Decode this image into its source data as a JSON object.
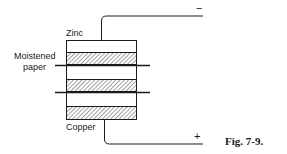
{
  "diagram": {
    "labels": {
      "zinc": "Zinc",
      "moistened_line1": "Moistened",
      "moistened_line2": "paper",
      "copper": "Copper",
      "negative": "−",
      "positive": "+"
    },
    "caption": "Fig. 7-9.",
    "layers": [
      {
        "type": "zinc",
        "hatched": false
      },
      {
        "type": "copper",
        "hatched": true
      },
      {
        "type": "moistened-paper",
        "divider": true
      },
      {
        "type": "zinc",
        "hatched": false
      },
      {
        "type": "copper",
        "hatched": true
      },
      {
        "type": "moistened-paper",
        "divider": true
      },
      {
        "type": "zinc",
        "hatched": false
      },
      {
        "type": "copper",
        "hatched": true
      }
    ],
    "colors": {
      "ink": "#1a1a1a",
      "background": "#ffffff"
    }
  }
}
